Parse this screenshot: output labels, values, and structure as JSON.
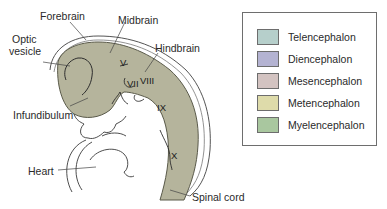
{
  "diagram": {
    "labels": {
      "forebrain": "Forebrain",
      "midbrain": "Midbrain",
      "optic_vesicle_1": "Optic",
      "optic_vesicle_2": "vesicle",
      "hindbrain": "Hindbrain",
      "infundibulum": "Infundibulum",
      "heart": "Heart",
      "spinal_cord": "Spinal cord"
    },
    "cranial_nerves": {
      "v": "V",
      "vii": "VII",
      "viii": "VIII",
      "ix": "IX",
      "x": "X"
    },
    "neural_tube_color": "#b5b49c"
  },
  "legend": {
    "items": [
      {
        "label": "Telencephalon",
        "color": "#b6cfcb"
      },
      {
        "label": "Diencephalon",
        "color": "#b4b3d2"
      },
      {
        "label": "Mesencephalon",
        "color": "#d3c3c1"
      },
      {
        "label": "Metencephalon",
        "color": "#dedbaa"
      },
      {
        "label": "Myelencephalon",
        "color": "#a9c79f"
      }
    ]
  }
}
